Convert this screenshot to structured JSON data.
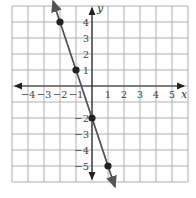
{
  "chart_data": {
    "type": "line",
    "title": "",
    "xlabel": "x",
    "ylabel": "y",
    "xlim": [
      -5,
      6
    ],
    "ylim": [
      -6,
      5
    ],
    "grid": true,
    "x_ticks": [
      "-4",
      "-3",
      "-2",
      "-1",
      "1",
      "2",
      "3",
      "4",
      "5"
    ],
    "y_ticks": [
      "4",
      "3",
      "2",
      "1",
      "-2",
      "-3",
      "-4",
      "-5"
    ],
    "points": [
      {
        "x": -2,
        "y": 4
      },
      {
        "x": -1,
        "y": 1
      },
      {
        "x": 0,
        "y": -2
      },
      {
        "x": 1,
        "y": -5
      }
    ],
    "line": {
      "slope": -3,
      "intercept": -2,
      "arrows": "both"
    },
    "colors": {
      "line": "#555555",
      "points": "#222222",
      "grid": "#b0b0b0",
      "axes": "#222222"
    }
  }
}
